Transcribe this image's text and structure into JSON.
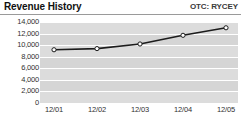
{
  "header": {
    "title": "Revenue History",
    "ticker": "OTC: RYCEY"
  },
  "colors": {
    "plot_background": "#d5d5d5",
    "band": "#dcdcdc",
    "gridline": "#ffffff",
    "line": "#1c1c1c",
    "marker_fill": "#ffffff",
    "marker_stroke": "#1c1c1c",
    "rule": "#9a9a9a",
    "text": "#1a1a1a"
  },
  "chart_data": {
    "type": "line",
    "title": "Revenue History",
    "subtitle": "OTC: RYCEY",
    "xlabel": "",
    "ylabel": "",
    "categories": [
      "12/01",
      "12/02",
      "12/03",
      "12/04",
      "12/05"
    ],
    "values": [
      9200,
      9400,
      10200,
      11700,
      13000
    ],
    "series": [
      {
        "name": "Revenue",
        "values": [
          9200,
          9400,
          10200,
          11700,
          13000
        ]
      }
    ],
    "ylim": [
      0,
      14000
    ],
    "yticks": [
      14000,
      12000,
      10000,
      8000,
      6000,
      4000,
      2000,
      0
    ],
    "ytick_labels": [
      "14,000",
      "12,000",
      "10,000",
      "8,000",
      "6,000",
      "4,000",
      "2,000",
      "0"
    ],
    "xtick_labels": [
      "12/01",
      "12/02",
      "12/03",
      "12/04",
      "12/05"
    ],
    "grid": true,
    "grid_orientation": "horizontal",
    "legend": false,
    "markers": "open-circle"
  }
}
